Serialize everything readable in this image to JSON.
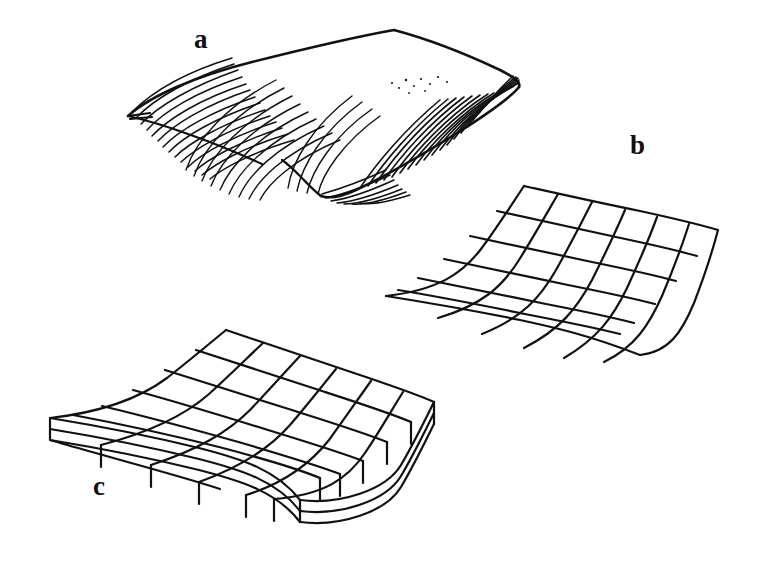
{
  "figure": {
    "kind": "line-drawing-illustration",
    "caption_labels": [
      "a",
      "b",
      "c"
    ],
    "background_color": "#ffffff",
    "ink_color": "#111111",
    "panels": [
      {
        "id": "a",
        "label": "a",
        "label_position": {
          "x": 194,
          "y": 26
        },
        "description": "hand-drawn shaded curved surface rendered with dense curved hatching strokes",
        "style": "hatched-shading",
        "outline": [
          [
            128,
            116
          ],
          [
            170,
            80
          ],
          [
            260,
            60
          ],
          [
            330,
            45
          ],
          [
            392,
            30
          ],
          [
            452,
            48
          ],
          [
            500,
            66
          ],
          [
            520,
            80
          ],
          [
            508,
            100
          ],
          [
            470,
            126
          ],
          [
            430,
            150
          ],
          [
            390,
            172
          ],
          [
            350,
            190
          ],
          [
            318,
            197
          ],
          [
            296,
            186
          ],
          [
            268,
            164
          ],
          [
            222,
            142
          ],
          [
            170,
            126
          ]
        ],
        "hatch_groups": [
          {
            "name": "left-dense-bundle",
            "strokes": 14,
            "density": "high"
          },
          {
            "name": "left-mid-bundle",
            "strokes": 9,
            "density": "medium"
          },
          {
            "name": "center-sparse",
            "strokes": 4,
            "density": "low"
          },
          {
            "name": "right-dense-bundle",
            "strokes": 18,
            "density": "high"
          },
          {
            "name": "bottom-fold-bundle",
            "strokes": 7,
            "density": "medium"
          }
        ]
      },
      {
        "id": "b",
        "label": "b",
        "label_position": {
          "x": 630,
          "y": 132
        },
        "description": "wireframe mesh of the same curved surface, no shading, open quadrilateral grid",
        "style": "wireframe-mesh",
        "grid_rows": 6,
        "grid_cols": 6,
        "corners": {
          "back_left": [
            524,
            186
          ],
          "back_right": [
            718,
            230
          ],
          "front_right": [
            640,
            355
          ],
          "front_left": [
            386,
            296
          ]
        }
      },
      {
        "id": "c",
        "label": "c",
        "label_position": {
          "x": 93,
          "y": 473
        },
        "description": "solid slab: curved meshed top surface extruded downward showing two side faces with matching panel divisions",
        "style": "extruded-slab-mesh",
        "grid_rows": 6,
        "grid_cols": 6,
        "slab_depth_px": 42,
        "corners": {
          "back_left": [
            226,
            330
          ],
          "back_right": [
            434,
            402
          ],
          "front_right": [
            300,
            500
          ],
          "front_left": [
            50,
            418
          ]
        }
      }
    ]
  }
}
